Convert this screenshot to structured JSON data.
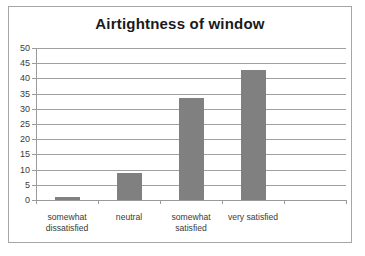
{
  "chart_data": {
    "type": "bar",
    "title": "Airtightness of window",
    "xlabel": "",
    "ylabel": "",
    "categories": [
      "somewhat dissatisfied",
      "neutral",
      "somewhat satisfied",
      "very satisfied"
    ],
    "category_lines": [
      [
        "somewhat",
        "dissatisfied"
      ],
      [
        "neutral",
        ""
      ],
      [
        "somewhat",
        "satisfied"
      ],
      [
        "very satisfied",
        ""
      ]
    ],
    "values": [
      1.0,
      8.8,
      33.7,
      42.7
    ],
    "ylim": [
      0,
      50
    ],
    "y_ticks": [
      0,
      5,
      10,
      15,
      20,
      25,
      30,
      35,
      40,
      45,
      50
    ],
    "y_tick_labels": [
      "0",
      "5",
      "10",
      "15",
      "20",
      "25",
      "30",
      "35",
      "40",
      "45",
      "50"
    ],
    "grid": true,
    "legend": false,
    "bar_color": "#808080",
    "gridline_color": "#a0a0a0",
    "axis_color": "#9a9a9a",
    "border_color": "#a6a6a6",
    "background": "#ffffff",
    "title_color": "#1a1a1a",
    "tick_label_color": "#3a3a3a",
    "empty_trailing_slot": true
  }
}
